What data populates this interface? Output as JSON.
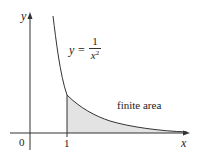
{
  "figure": {
    "function_label": {
      "lhs": "y",
      "eq": "=",
      "numerator": "1",
      "denominator_var": "x",
      "denominator_exp": "2"
    },
    "region_label": "finite area",
    "axis_labels": {
      "x": "x",
      "y": "y"
    },
    "tick_labels": {
      "origin": "0",
      "x1": "1"
    },
    "colors": {
      "curve": "#333333",
      "axis": "#333333",
      "fill": "#e3e3e3"
    }
  }
}
